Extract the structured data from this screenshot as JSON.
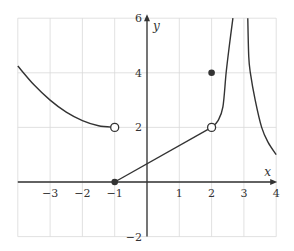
{
  "chart_data": {
    "type": "line",
    "title": "",
    "xlabel": "x",
    "ylabel": "y",
    "xlim": [
      -4,
      4
    ],
    "ylim": [
      -2,
      6
    ],
    "grid": true,
    "x_ticks": [
      -3,
      -2,
      -1,
      1,
      2,
      3,
      4
    ],
    "x_tick_labels": [
      "−3",
      "−2",
      "−1",
      "1",
      "2",
      "3",
      "4"
    ],
    "y_ticks": [
      -2,
      2,
      4,
      6
    ],
    "y_tick_labels": [
      "−2",
      "2",
      "4",
      "6"
    ],
    "series": [
      {
        "name": "left-parabola",
        "description": "decreasing curve from (-4, 4.25) to open circle at (-1, 2)",
        "points": [
          [
            -4,
            4.25
          ],
          [
            -3.5,
            3.56
          ],
          [
            -3,
            3.0
          ],
          [
            -2.5,
            2.56
          ],
          [
            -2,
            2.25
          ],
          [
            -1.5,
            2.06
          ],
          [
            -1,
            2.0
          ]
        ]
      },
      {
        "name": "line-segment",
        "description": "straight segment from closed point (-1, 0) to open circle at (2, 2)",
        "points": [
          [
            -1,
            0
          ],
          [
            2,
            2
          ]
        ]
      },
      {
        "name": "asymptote-left-branch",
        "description": "rising branch from (2, 2) toward vertical asymptote near x≈2.9",
        "points": [
          [
            2,
            2
          ],
          [
            2.2,
            2.25
          ],
          [
            2.35,
            2.75
          ],
          [
            2.45,
            4.0
          ],
          [
            2.55,
            5.0
          ],
          [
            2.66,
            6.0
          ]
        ]
      },
      {
        "name": "asymptote-right-branch",
        "description": "decreasing branch from top near x≈3.1 down to (4, 1)",
        "points": [
          [
            3.12,
            6.0
          ],
          [
            3.15,
            4.6
          ],
          [
            3.2,
            4.0
          ],
          [
            3.35,
            3.0
          ],
          [
            3.55,
            2.0
          ],
          [
            3.75,
            1.45
          ],
          [
            4,
            1.0
          ]
        ]
      }
    ],
    "markers": [
      {
        "x": -1,
        "y": 2,
        "type": "open"
      },
      {
        "x": -1,
        "y": 0,
        "type": "closed"
      },
      {
        "x": 2,
        "y": 2,
        "type": "open"
      },
      {
        "x": 2,
        "y": 4,
        "type": "closed"
      }
    ]
  },
  "colors": {
    "grid": "#d9d9d9",
    "axis": "#333333",
    "curve": "#333333"
  }
}
